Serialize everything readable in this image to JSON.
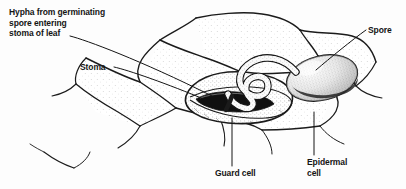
{
  "figure": {
    "type": "biological-diagram",
    "style": "pen-and-ink stipple line drawing",
    "background_color": "#fdfdfd",
    "ink_color": "#141414",
    "labels": [
      {
        "id": "hypha",
        "text": "Hypha from germinating\nspore entering\nstoma of leaf",
        "lines": [
          "Hypha from germinating",
          "spore entering",
          "stoma of leaf"
        ],
        "leader": "diagonal-down-right"
      },
      {
        "id": "stoma",
        "text": "Stoma",
        "lines": [
          "Stoma"
        ],
        "leader": "diagonal-down-right"
      },
      {
        "id": "spore",
        "text": "Spore",
        "lines": [
          "Spore"
        ],
        "leader": "diagonal-down-left"
      },
      {
        "id": "guard_cell",
        "text": "Guard cell",
        "lines": [
          "Guard cell"
        ],
        "leader": "vertical-up"
      },
      {
        "id": "epidermal_cell",
        "text": "Epidermal\ncell",
        "lines": [
          "Epidermal",
          "cell"
        ],
        "leader": "vertical-up"
      }
    ],
    "structures": [
      "epidermal-cell-wall-network",
      "guard-cell-pair",
      "stomatal-pore",
      "fungal-spore",
      "germ-tube-hypha"
    ]
  }
}
